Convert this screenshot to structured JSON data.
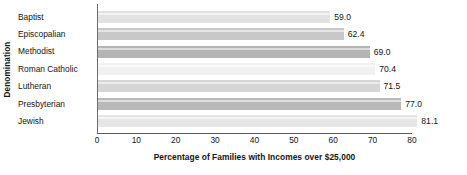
{
  "chart_data": {
    "type": "bar",
    "orientation": "horizontal",
    "title": "",
    "xlabel": "Percentage of Families with Incomes over $25,000",
    "ylabel": "Denomination",
    "categories": [
      "Baptist",
      "Episcopalian",
      "Methodist",
      "Roman Catholic",
      "Lutheran",
      "Presbyterian",
      "Jewish"
    ],
    "values": [
      59.0,
      62.4,
      69.0,
      70.4,
      71.5,
      77.0,
      81.1
    ],
    "value_labels": [
      "59.0",
      "62.4",
      "69.0",
      "70.4",
      "71.5",
      "77.0",
      "81.1"
    ],
    "xlim": [
      0,
      80
    ],
    "xticks": [
      0,
      10,
      20,
      30,
      40,
      50,
      60,
      70,
      80
    ],
    "xtick_labels": [
      "0",
      "10",
      "20",
      "30",
      "40",
      "50",
      "60",
      "70",
      "80"
    ],
    "grid": false,
    "legend": null,
    "bar_colors": [
      "#e2e2e2",
      "#c8c8c8",
      "#b4b4b4",
      "#f1f1f1",
      "#d6d6d6",
      "#b9b9b9",
      "#e6e6e6"
    ],
    "axis_color": "#5a5a5a",
    "text_color": "#141414",
    "background": "#ffffff"
  }
}
